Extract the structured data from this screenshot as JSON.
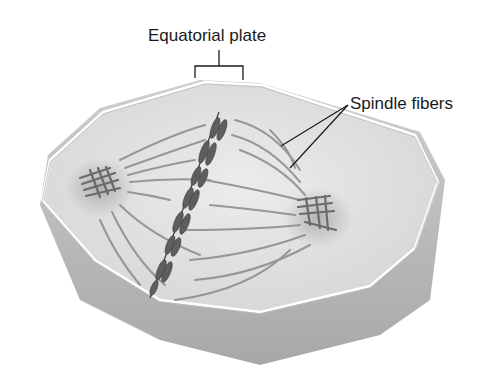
{
  "diagram": {
    "labels": {
      "equatorial_plate": "Equatorial plate",
      "spindle_fibers": "Spindle fibers"
    },
    "colors": {
      "cell_fill": "#e6e6e6",
      "cell_side": "#b9b9b9",
      "fiber": "#8a8a8a",
      "chromosome": "#5e5e5e",
      "label_text": "#1a1a1a"
    }
  }
}
